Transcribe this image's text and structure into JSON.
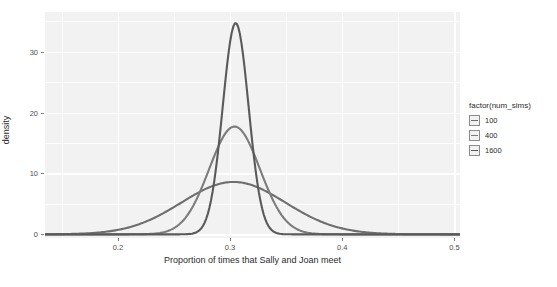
{
  "chart_data": {
    "type": "line",
    "title": "",
    "subtitle": "",
    "xlabel": "Proportion of times that Sally and Joan meet",
    "ylabel": "density",
    "xlim": [
      0.135,
      0.505
    ],
    "ylim": [
      -0.6,
      36.5
    ],
    "xticks": [
      0.2,
      0.3,
      0.4,
      0.5
    ],
    "xtick_labels": [
      "0.2",
      "0.3",
      "0.4",
      "0.5"
    ],
    "yticks": [
      0,
      10,
      20,
      30
    ],
    "ytick_labels": [
      "0",
      "10",
      "20",
      "30"
    ],
    "grid": true,
    "legend_position": "right",
    "legend_title": "factor(num_sims)",
    "panel_background": "#f2f2f2",
    "grid_color": "#ffffff",
    "series": [
      {
        "name": "100",
        "color": "#6e6e6e",
        "mean": 0.303,
        "sd": 0.0464,
        "peak_density": 8.6,
        "x": [
          0.135,
          0.15,
          0.165,
          0.18,
          0.195,
          0.21,
          0.225,
          0.24,
          0.255,
          0.27,
          0.285,
          0.3,
          0.303,
          0.315,
          0.33,
          0.345,
          0.36,
          0.375,
          0.39,
          0.405,
          0.42,
          0.435,
          0.45,
          0.465,
          0.48,
          0.495,
          0.505
        ],
        "values": [
          0.12,
          0.23,
          0.43,
          0.76,
          1.25,
          1.97,
          2.92,
          4.08,
          5.37,
          6.63,
          7.68,
          8.45,
          8.6,
          8.42,
          7.66,
          6.6,
          5.35,
          4.06,
          2.9,
          1.95,
          1.24,
          0.75,
          0.42,
          0.22,
          0.11,
          0.05,
          0.03
        ]
      },
      {
        "name": "400",
        "color": "#7c7c7c",
        "mean": 0.304,
        "sd": 0.0226,
        "peak_density": 17.7,
        "x": [
          0.21,
          0.225,
          0.24,
          0.25,
          0.26,
          0.27,
          0.28,
          0.29,
          0.295,
          0.304,
          0.31,
          0.32,
          0.33,
          0.34,
          0.35,
          0.36,
          0.37,
          0.38,
          0.39,
          0.4,
          0.41,
          0.42
        ],
        "values": [
          0.05,
          0.12,
          0.58,
          1.48,
          3.14,
          5.7,
          9.1,
          13.6,
          15.6,
          17.7,
          17.2,
          15.2,
          12.2,
          8.8,
          5.8,
          3.4,
          1.8,
          0.85,
          0.36,
          0.14,
          0.05,
          0.02
        ]
      },
      {
        "name": "1600",
        "color": "#5a5a5a",
        "mean": 0.305,
        "sd": 0.0115,
        "peak_density": 34.7,
        "x": [
          0.265,
          0.272,
          0.278,
          0.284,
          0.29,
          0.295,
          0.3,
          0.305,
          0.31,
          0.315,
          0.32,
          0.326,
          0.332,
          0.338,
          0.345,
          0.352,
          0.36
        ],
        "values": [
          0.15,
          0.65,
          2.1,
          5.4,
          11.6,
          19.4,
          28.6,
          34.7,
          32.0,
          23.8,
          14.6,
          7.2,
          2.8,
          0.9,
          0.25,
          0.07,
          0.02
        ]
      }
    ]
  },
  "legend": {
    "title": "factor(num_sims)",
    "items": [
      {
        "label": "100"
      },
      {
        "label": "400"
      },
      {
        "label": "1600"
      }
    ]
  },
  "axes": {
    "x_label": "Proportion of times that Sally and Joan meet",
    "y_label": "density"
  }
}
